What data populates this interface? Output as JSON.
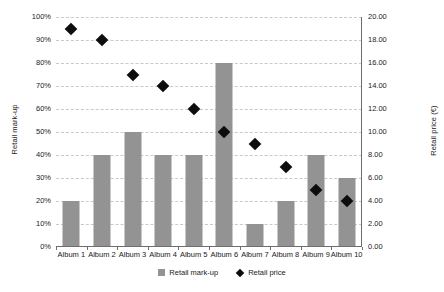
{
  "chart_data": {
    "type": "bar",
    "title": "",
    "subtitle": "",
    "xlabel": "",
    "ylabel": "Retail mark-up",
    "y2label": "Retail price (€)",
    "categories": [
      "Album 1",
      "Album 2",
      "Album 3",
      "Album 4",
      "Album 5",
      "Album 6",
      "Album 7",
      "Album 8",
      "Album 9",
      "Album 10"
    ],
    "series": [
      {
        "name": "Retail mark-up",
        "type": "bar",
        "axis": "left",
        "color": "#939393",
        "unit": "%",
        "values": [
          20,
          40,
          50,
          40,
          40,
          80,
          10,
          20,
          40,
          30
        ]
      },
      {
        "name": "Retail price",
        "type": "scatter",
        "marker": "diamond",
        "axis": "right",
        "color": "#0d0d0d",
        "unit": "€",
        "values": [
          19.0,
          18.0,
          15.0,
          14.0,
          12.0,
          10.0,
          9.0,
          7.0,
          5.0,
          4.0
        ]
      }
    ],
    "ylim": [
      0,
      100
    ],
    "y2lim": [
      0,
      20
    ],
    "yticks": [
      0,
      10,
      20,
      30,
      40,
      50,
      60,
      70,
      80,
      90,
      100
    ],
    "ytick_labels": [
      "0%",
      "10%",
      "20%",
      "30%",
      "40%",
      "50%",
      "60%",
      "70%",
      "80%",
      "90%",
      "100%"
    ],
    "y2ticks": [
      0,
      2,
      4,
      6,
      8,
      10,
      12,
      14,
      16,
      18,
      20
    ],
    "y2tick_labels": [
      "0.00",
      "2.00",
      "4.00",
      "6.00",
      "8.00",
      "10.00",
      "12.00",
      "14.00",
      "16.00",
      "18.00",
      "20.00"
    ],
    "grid": true,
    "grid_axis": "y",
    "grid_style": "dashed",
    "grid_color": "#c9c9c9",
    "legend": [
      "Retail mark-up",
      "Retail price"
    ],
    "legend_position": "bottom",
    "background": "#ffffff"
  }
}
